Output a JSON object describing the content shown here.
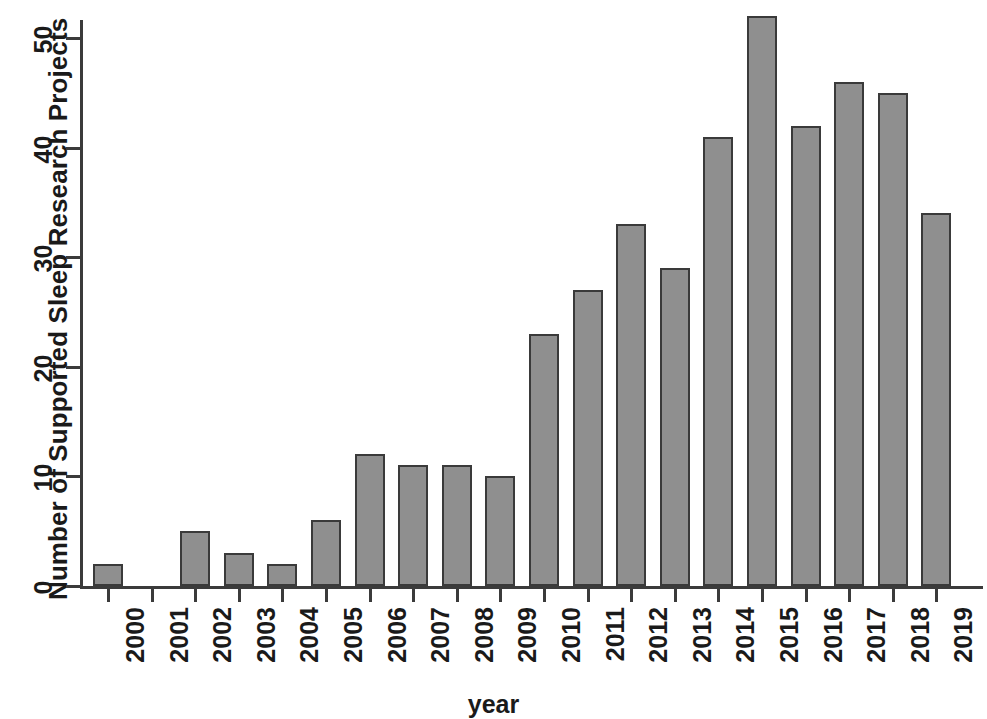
{
  "chart_data": {
    "type": "bar",
    "title": "",
    "xlabel": "year",
    "ylabel": "Number of Supported Sleep Research Projects",
    "categories": [
      "2000",
      "2001",
      "2002",
      "2003",
      "2004",
      "2005",
      "2006",
      "2007",
      "2008",
      "2009",
      "2010",
      "2011",
      "2012",
      "2013",
      "2014",
      "2015",
      "2016",
      "2017",
      "2018",
      "2019"
    ],
    "values": [
      2,
      0,
      5,
      3,
      2,
      6,
      12,
      11,
      11,
      10,
      23,
      27,
      33,
      29,
      41,
      52,
      42,
      46,
      45,
      34
    ],
    "ylim": [
      0,
      52
    ],
    "y_ticks": [
      0,
      10,
      20,
      30,
      40,
      50
    ],
    "y_tick_labels": [
      "0",
      "10",
      "20",
      "30",
      "40",
      "50"
    ],
    "grid": false,
    "legend": false,
    "bar_color": "#8f8f8f",
    "bar_border_color": "#3a3a3a",
    "axis_color": "#3b3b3b",
    "text_color": "#1a1a1a"
  }
}
